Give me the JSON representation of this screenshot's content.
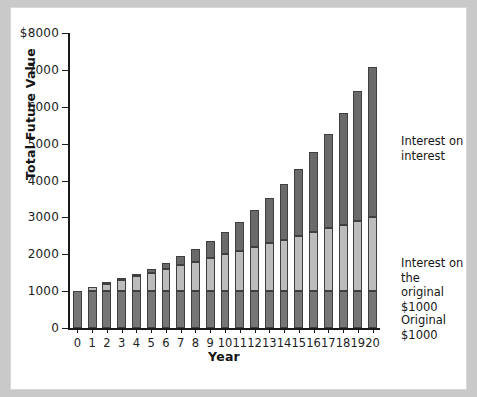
{
  "chart_data": {
    "type": "bar",
    "title": "",
    "xlabel": "Year",
    "ylabel": "Total Future Value",
    "ylim": [
      0,
      8000
    ],
    "yticks": [
      0,
      1000,
      2000,
      3000,
      4000,
      5000,
      6000,
      7000,
      8000
    ],
    "ytick_labels": [
      "0",
      "1000",
      "2000",
      "3000",
      "4000",
      "5000",
      "6000",
      "7000",
      "$8000"
    ],
    "grid": false,
    "legend_position": "right-inline-annotations",
    "stacked": true,
    "categories": [
      "0",
      "1",
      "2",
      "3",
      "4",
      "5",
      "6",
      "7",
      "8",
      "9",
      "10",
      "11",
      "12",
      "13",
      "14",
      "15",
      "16",
      "17",
      "18",
      "19",
      "20"
    ],
    "series": [
      {
        "name": "Original $1000",
        "color": "#767676",
        "values": [
          1000,
          1000,
          1000,
          1000,
          1000,
          1000,
          1000,
          1000,
          1000,
          1000,
          1000,
          1000,
          1000,
          1000,
          1000,
          1000,
          1000,
          1000,
          1000,
          1000,
          1000
        ]
      },
      {
        "name": "Interest on the original $1000",
        "color": "#bcbcbc",
        "values": [
          0,
          100,
          200,
          300,
          400,
          500,
          600,
          700,
          800,
          900,
          1000,
          1100,
          1200,
          1300,
          1400,
          1500,
          1600,
          1700,
          1800,
          1900,
          2000
        ]
      },
      {
        "name": "Interest on interest",
        "color": "#6a6a6a",
        "values": [
          0,
          0,
          10,
          31,
          64,
          111,
          172,
          251,
          349,
          469,
          614,
          785,
          988,
          1223,
          1496,
          1807,
          2163,
          2566,
          3018,
          3525,
          4091
        ]
      }
    ],
    "totals": [
      1000,
      1100,
      1210,
      1331,
      1464,
      1611,
      1772,
      1949,
      2144,
      2358,
      2594,
      2853,
      3138,
      3452,
      3797,
      4177,
      4595,
      5054,
      5560,
      6116,
      6727
    ],
    "annotations": [
      {
        "id": "interest-on-interest",
        "text": "Interest on\ninterest"
      },
      {
        "id": "interest-original",
        "text": "Interest on the\noriginal $1000"
      },
      {
        "id": "original",
        "text": "Original\n$1000"
      }
    ]
  }
}
